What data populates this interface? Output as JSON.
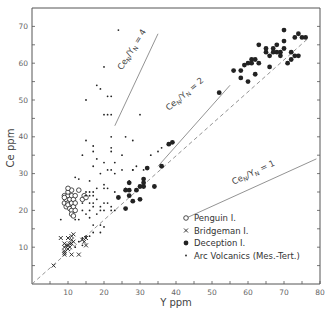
{
  "chart_data": {
    "type": "scatter",
    "title": "",
    "xlabel": "Y ppm",
    "ylabel": "Ce ppm",
    "xlim": [
      0,
      80
    ],
    "ylim": [
      0,
      75
    ],
    "xticks": [
      10,
      20,
      30,
      40,
      50,
      60,
      70,
      80
    ],
    "yticks": [
      10,
      20,
      30,
      40,
      50,
      60,
      70
    ],
    "grid": false,
    "legend_position": "lower right",
    "reference_lines": [
      {
        "label": "Ce_N/Y_N = 4",
        "text_main": "Ce",
        "sub1": "N",
        "mid": "/Y",
        "sub2": "N",
        "tail": " = 4",
        "x": [
          23,
          35
        ],
        "y": [
          43,
          68
        ],
        "style": "solid"
      },
      {
        "label": "Ce_N/Y_N = 2",
        "text_main": "Ce",
        "sub1": "N",
        "mid": "/Y",
        "sub2": "N",
        "tail": " = 2",
        "x": [
          35,
          55
        ],
        "y": [
          32,
          54
        ],
        "style": "solid"
      },
      {
        "label": "Ce_N/Y_N = 1",
        "text_main": "Ce",
        "sub1": "N",
        "mid": "/Y",
        "sub2": "N",
        "tail": " = 1",
        "x": [
          43,
          79
        ],
        "y": [
          18,
          34
        ],
        "style": "solid"
      },
      {
        "label": "1:1 trend",
        "x": [
          0,
          77
        ],
        "y": [
          0,
          67
        ],
        "style": "dashed"
      }
    ],
    "series": [
      {
        "name": "Penguin I.",
        "marker": "open-circle",
        "points": [
          [
            9,
            22
          ],
          [
            9,
            24
          ],
          [
            9.5,
            21
          ],
          [
            9.5,
            23
          ],
          [
            10,
            22
          ],
          [
            10,
            24
          ],
          [
            10,
            25
          ],
          [
            10,
            21.5
          ],
          [
            10.5,
            23
          ],
          [
            10.5,
            20.5
          ],
          [
            11,
            22
          ],
          [
            11,
            24
          ],
          [
            11,
            25.5
          ],
          [
            11,
            20
          ],
          [
            11,
            19
          ],
          [
            11.5,
            21
          ],
          [
            11.5,
            23
          ],
          [
            11.5,
            18.5
          ],
          [
            12,
            22
          ],
          [
            12,
            20
          ],
          [
            12,
            24
          ],
          [
            13,
            25.5
          ],
          [
            14,
            23
          ],
          [
            14.5,
            24
          ],
          [
            15,
            23.5
          ],
          [
            10,
            26
          ],
          [
            9,
            23.5
          ]
        ]
      },
      {
        "name": "Bridgeman I.",
        "marker": "cross",
        "points": [
          [
            6,
            5
          ],
          [
            8,
            12.5
          ],
          [
            9,
            8
          ],
          [
            9,
            9
          ],
          [
            9,
            10
          ],
          [
            9,
            11
          ],
          [
            9.5,
            10.5
          ],
          [
            10,
            9.5
          ],
          [
            10,
            10.5
          ],
          [
            10,
            12.5
          ],
          [
            10.5,
            10
          ],
          [
            10.5,
            11
          ],
          [
            11,
            11
          ],
          [
            11,
            12
          ],
          [
            11,
            13
          ],
          [
            11,
            8
          ],
          [
            11.5,
            11.5
          ],
          [
            11.5,
            13.5
          ],
          [
            13,
            8
          ],
          [
            14,
            12
          ],
          [
            14.5,
            11.5
          ],
          [
            15,
            12.5
          ],
          [
            15,
            10.5
          ],
          [
            9,
            8.5
          ]
        ]
      },
      {
        "name": "Deception I.",
        "marker": "filled-circle",
        "points": [
          [
            24,
            23.5
          ],
          [
            26,
            20.5
          ],
          [
            26,
            25.5
          ],
          [
            27,
            27.5
          ],
          [
            27,
            25.5
          ],
          [
            27,
            24
          ],
          [
            28,
            22.5
          ],
          [
            29,
            25.5
          ],
          [
            30,
            23
          ],
          [
            30,
            26.5
          ],
          [
            31,
            28.5
          ],
          [
            31,
            27.5
          ],
          [
            31,
            26.5
          ],
          [
            32,
            31.5
          ],
          [
            34,
            26.5
          ],
          [
            36,
            32
          ],
          [
            38,
            38
          ],
          [
            39,
            38.5
          ],
          [
            52,
            52
          ],
          [
            56,
            58
          ],
          [
            58,
            56
          ],
          [
            58,
            58
          ],
          [
            59,
            59.5
          ],
          [
            60,
            60
          ],
          [
            60,
            55
          ],
          [
            61,
            60
          ],
          [
            61,
            61
          ],
          [
            62,
            61
          ],
          [
            62,
            57
          ],
          [
            63,
            60
          ],
          [
            63,
            65
          ],
          [
            65,
            63
          ],
          [
            65,
            64
          ],
          [
            66,
            62
          ],
          [
            66,
            59
          ],
          [
            67,
            63
          ],
          [
            67,
            64
          ],
          [
            68,
            63
          ],
          [
            68,
            65
          ],
          [
            69,
            62
          ],
          [
            69,
            63
          ],
          [
            70,
            69
          ],
          [
            70,
            64
          ],
          [
            70,
            66
          ],
          [
            71,
            60
          ],
          [
            72,
            63
          ],
          [
            73,
            62
          ],
          [
            73,
            67
          ],
          [
            74,
            68
          ],
          [
            74,
            62
          ],
          [
            75,
            67
          ],
          [
            76,
            67
          ],
          [
            72,
            61
          ]
        ]
      },
      {
        "name": "Arc Volcanics (Mes.-Tert.)",
        "marker": "dot",
        "points": [
          [
            24,
            69
          ],
          [
            20,
            59
          ],
          [
            18,
            54
          ],
          [
            19,
            53
          ],
          [
            15,
            50
          ],
          [
            21,
            51
          ],
          [
            22,
            51
          ],
          [
            20,
            46
          ],
          [
            21,
            46
          ],
          [
            22,
            46
          ],
          [
            30,
            46
          ],
          [
            22,
            40
          ],
          [
            26,
            40
          ],
          [
            15,
            39
          ],
          [
            17,
            37.5
          ],
          [
            22,
            37
          ],
          [
            17,
            36
          ],
          [
            22,
            36
          ],
          [
            28,
            39
          ],
          [
            14,
            35
          ],
          [
            18,
            34
          ],
          [
            25,
            35
          ],
          [
            20,
            33
          ],
          [
            23,
            33
          ],
          [
            17,
            32
          ],
          [
            21,
            31
          ],
          [
            22,
            31
          ],
          [
            25,
            31
          ],
          [
            28,
            31
          ],
          [
            31,
            31
          ],
          [
            13,
            28.5
          ],
          [
            16,
            28
          ],
          [
            12,
            29
          ],
          [
            19,
            30
          ],
          [
            23,
            30
          ],
          [
            20,
            27
          ],
          [
            18,
            26
          ],
          [
            20,
            26
          ],
          [
            21,
            26
          ],
          [
            15,
            25
          ],
          [
            16,
            25
          ],
          [
            17,
            25
          ],
          [
            15,
            24
          ],
          [
            16,
            24
          ],
          [
            17,
            24
          ],
          [
            14,
            22
          ],
          [
            16,
            22
          ],
          [
            17,
            22
          ],
          [
            19,
            21
          ],
          [
            19,
            20
          ],
          [
            20,
            20
          ],
          [
            22,
            21
          ],
          [
            22,
            20
          ],
          [
            23,
            20
          ],
          [
            14,
            20
          ],
          [
            15,
            19
          ],
          [
            16,
            18
          ],
          [
            17,
            16
          ],
          [
            19,
            16
          ],
          [
            20,
            15.5
          ],
          [
            13,
            17.5
          ],
          [
            12,
            17.5
          ],
          [
            8,
            17.5
          ],
          [
            19,
            14
          ],
          [
            17,
            14
          ],
          [
            16,
            13
          ],
          [
            15,
            13
          ],
          [
            14,
            12.5
          ],
          [
            13,
            11.5
          ],
          [
            12,
            10
          ],
          [
            14,
            10.5
          ],
          [
            28,
            31
          ],
          [
            35,
            36
          ],
          [
            36,
            37
          ],
          [
            33,
            35
          ],
          [
            29,
            32
          ],
          [
            17,
            21
          ],
          [
            20,
            22
          ],
          [
            18,
            23
          ],
          [
            21,
            22
          ],
          [
            23,
            25
          ],
          [
            26,
            26
          ],
          [
            27,
            28
          ],
          [
            18,
            19
          ],
          [
            16,
            20
          ]
        ]
      }
    ]
  },
  "legend": {
    "items": [
      {
        "label": "Penguin I.",
        "marker": "open-circle"
      },
      {
        "label": "Bridgeman I.",
        "marker": "cross"
      },
      {
        "label": "Deception I.",
        "marker": "filled-circle"
      },
      {
        "label": "Arc Volcanics (Mes.-Tert.)",
        "marker": "dot"
      }
    ]
  },
  "axes": {
    "x_title": "Y ppm",
    "y_title": "Ce ppm",
    "x_tick_labels": [
      "10",
      "20",
      "30",
      "40",
      "50",
      "60",
      "70",
      "80"
    ],
    "y_tick_labels": [
      "10",
      "20",
      "30",
      "40",
      "50",
      "60",
      "70"
    ]
  },
  "colors": {
    "ink": "#222222",
    "axis": "#555555",
    "reference_line": "#777777",
    "background": "#ffffff"
  }
}
